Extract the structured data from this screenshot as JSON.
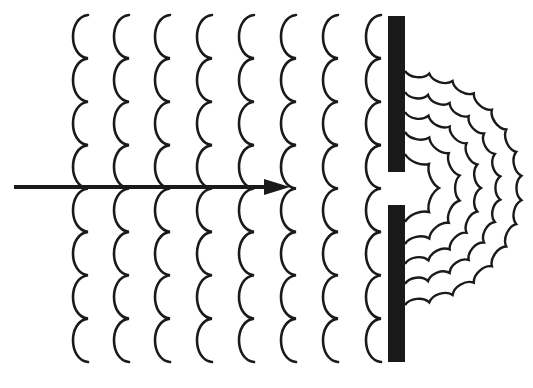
{
  "figure": {
    "title": "Diffraction of plane waves through a single slit",
    "colors": {
      "ink": "#1a1a1a",
      "background": "#ffffff"
    },
    "incident_waves": {
      "count": 8,
      "cusp_x": [
        88,
        129,
        170,
        212,
        254,
        296,
        338,
        381
      ],
      "y_top": 15,
      "y_bottom": 362,
      "scallops": 8,
      "bulge": 16
    },
    "arrow": {
      "x1": 14,
      "x2": 290,
      "y": 187,
      "label": "direction of propagation"
    },
    "barrier": {
      "x": 388,
      "width": 17,
      "upper": {
        "y1": 16,
        "y2": 172
      },
      "lower": {
        "y1": 205,
        "y2": 362
      },
      "slit_center_y": 188
    },
    "diffracted_waves": {
      "center": [
        405,
        188
      ],
      "radii": [
        34,
        56,
        76,
        96,
        117
      ],
      "scallop_len": 24
    }
  }
}
